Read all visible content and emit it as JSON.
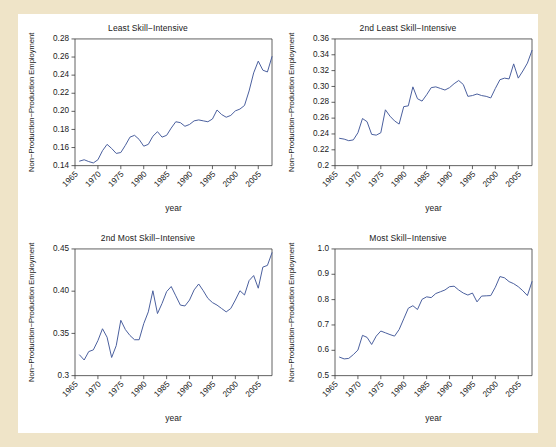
{
  "figure": {
    "background_color": "#efe4c8",
    "panel_background": "#ffffff",
    "line_color": "#4a5f9e",
    "axis_color": "#3a3a3a"
  },
  "chart_data": [
    {
      "type": "line",
      "title": "Least Skill−Intensive",
      "xlabel": "year",
      "ylabel": "Non−Production−Production Employment",
      "xlim": [
        1965,
        2008
      ],
      "ylim": [
        0.14,
        0.28
      ],
      "yticks": [
        "0.14",
        "0.16",
        "0.18",
        "0.20",
        "0.22",
        "0.24",
        "0.26",
        "0.28"
      ],
      "ytick_values": [
        0.14,
        0.16,
        0.18,
        0.2,
        0.22,
        0.24,
        0.26,
        0.28
      ],
      "xticks": [
        "1965",
        "1970",
        "1975",
        "1990",
        "1985",
        "1990",
        "1995",
        "2000",
        "2005"
      ],
      "xtick_values": [
        1965,
        1970,
        1975,
        1980,
        1985,
        1990,
        1995,
        2000,
        2005
      ],
      "grid": false,
      "legend": "none",
      "x": [
        1966,
        1967,
        1968,
        1969,
        1970,
        1971,
        1972,
        1973,
        1974,
        1975,
        1976,
        1977,
        1978,
        1979,
        1980,
        1981,
        1982,
        1983,
        1984,
        1985,
        1986,
        1987,
        1988,
        1989,
        1990,
        1991,
        1992,
        1993,
        1994,
        1995,
        1996,
        1997,
        1998,
        1999,
        2000,
        2001,
        2002,
        2003,
        2004,
        2005,
        2006,
        2007,
        2008
      ],
      "values": [
        0.145,
        0.1465,
        0.1445,
        0.143,
        0.1465,
        0.1565,
        0.1635,
        0.159,
        0.1535,
        0.1545,
        0.1625,
        0.1715,
        0.1735,
        0.169,
        0.1615,
        0.1635,
        0.1725,
        0.1775,
        0.1715,
        0.1735,
        0.1815,
        0.1885,
        0.1875,
        0.1835,
        0.1855,
        0.1895,
        0.1905,
        0.1895,
        0.1885,
        0.1915,
        0.2015,
        0.1965,
        0.1935,
        0.1955,
        0.2005,
        0.2025,
        0.2065,
        0.2225,
        0.2425,
        0.2555,
        0.2455,
        0.2435,
        0.2605
      ]
    },
    {
      "type": "line",
      "title": "2nd Least Skill−Intensive",
      "xlabel": "year",
      "ylabel": "Non−Production−Production Employment",
      "xlim": [
        1965,
        2008
      ],
      "ylim": [
        0.2,
        0.36
      ],
      "yticks": [
        "0.2",
        "0.22",
        "0.24",
        "0.26",
        "0.28",
        "0.30",
        "0.32",
        "0.34",
        "0.36"
      ],
      "ytick_values": [
        0.2,
        0.22,
        0.24,
        0.26,
        0.28,
        0.3,
        0.32,
        0.34,
        0.36
      ],
      "xticks": [
        "1965",
        "1970",
        "1975",
        "1990",
        "1985",
        "1990",
        "1995",
        "2000",
        "2005"
      ],
      "xtick_values": [
        1965,
        1970,
        1975,
        1980,
        1985,
        1990,
        1995,
        2000,
        2005
      ],
      "grid": false,
      "legend": "none",
      "x": [
        1966,
        1967,
        1968,
        1969,
        1970,
        1971,
        1972,
        1973,
        1974,
        1975,
        1976,
        1977,
        1978,
        1979,
        1980,
        1981,
        1982,
        1983,
        1984,
        1985,
        1986,
        1987,
        1988,
        1989,
        1990,
        1991,
        1992,
        1993,
        1994,
        1995,
        1996,
        1997,
        1998,
        1999,
        2000,
        2001,
        2002,
        2003,
        2004,
        2005,
        2006,
        2007,
        2008
      ],
      "values": [
        0.2345,
        0.2335,
        0.2315,
        0.2325,
        0.2415,
        0.2595,
        0.2555,
        0.2395,
        0.2385,
        0.2415,
        0.2705,
        0.2625,
        0.2565,
        0.2525,
        0.2745,
        0.2755,
        0.2995,
        0.2845,
        0.2815,
        0.2895,
        0.2985,
        0.2995,
        0.2975,
        0.2955,
        0.2985,
        0.3035,
        0.3075,
        0.3025,
        0.2875,
        0.2885,
        0.2905,
        0.2885,
        0.2875,
        0.2855,
        0.2975,
        0.3085,
        0.3105,
        0.3095,
        0.3285,
        0.3105,
        0.3195,
        0.3295,
        0.3455
      ]
    },
    {
      "type": "line",
      "title": "2nd Most Skill−Intensive",
      "xlabel": "year",
      "ylabel": "Non−Production−Production Employment",
      "xlim": [
        1965,
        2008
      ],
      "ylim": [
        0.3,
        0.45
      ],
      "yticks": [
        "0.3",
        "0.35",
        "0.40",
        "0.45"
      ],
      "ytick_values": [
        0.3,
        0.35,
        0.4,
        0.45
      ],
      "xticks": [
        "1965",
        "1970",
        "1975",
        "1990",
        "1985",
        "1990",
        "1995",
        "2000",
        "2005"
      ],
      "xtick_values": [
        1965,
        1970,
        1975,
        1980,
        1985,
        1990,
        1995,
        2000,
        2005
      ],
      "grid": false,
      "legend": "none",
      "x": [
        1966,
        1967,
        1968,
        1969,
        1970,
        1971,
        1972,
        1973,
        1974,
        1975,
        1976,
        1977,
        1978,
        1979,
        1980,
        1981,
        1982,
        1983,
        1984,
        1985,
        1986,
        1987,
        1988,
        1989,
        1990,
        1991,
        1992,
        1993,
        1994,
        1995,
        1996,
        1997,
        1998,
        1999,
        2000,
        2001,
        2002,
        2003,
        2004,
        2005,
        2006,
        2007,
        2008
      ],
      "values": [
        0.3245,
        0.3185,
        0.3285,
        0.3305,
        0.3415,
        0.3555,
        0.3455,
        0.3215,
        0.3355,
        0.3655,
        0.3545,
        0.3475,
        0.3425,
        0.3425,
        0.3615,
        0.3755,
        0.4005,
        0.3735,
        0.3855,
        0.3995,
        0.4055,
        0.3945,
        0.3835,
        0.3825,
        0.3895,
        0.4015,
        0.4085,
        0.4005,
        0.3915,
        0.3865,
        0.3835,
        0.3795,
        0.3755,
        0.3795,
        0.3895,
        0.4005,
        0.3955,
        0.4125,
        0.4185,
        0.4035,
        0.4285,
        0.4305,
        0.4455
      ]
    },
    {
      "type": "line",
      "title": "Most Skill−Intensive",
      "xlabel": "year",
      "ylabel": "Non−Production−Production Employment",
      "xlim": [
        1965,
        2008
      ],
      "ylim": [
        0.5,
        1.0
      ],
      "yticks": [
        "0.5",
        "0.6",
        "0.7",
        "0.8",
        "0.9",
        "1.0"
      ],
      "ytick_values": [
        0.5,
        0.6,
        0.7,
        0.8,
        0.9,
        1.0
      ],
      "xticks": [
        "1965",
        "1970",
        "1975",
        "1990",
        "1985",
        "1990",
        "1995",
        "2000",
        "2005"
      ],
      "xtick_values": [
        1965,
        1970,
        1975,
        1980,
        1985,
        1990,
        1995,
        2000,
        2005
      ],
      "grid": false,
      "legend": "none",
      "x": [
        1966,
        1967,
        1968,
        1969,
        1970,
        1971,
        1972,
        1973,
        1974,
        1975,
        1976,
        1977,
        1978,
        1979,
        1980,
        1981,
        1982,
        1983,
        1984,
        1985,
        1986,
        1987,
        1988,
        1989,
        1990,
        1991,
        1992,
        1993,
        1994,
        1995,
        1996,
        1997,
        1998,
        1999,
        2000,
        2001,
        2002,
        2003,
        2004,
        2005,
        2006,
        2007,
        2008
      ],
      "values": [
        0.573,
        0.566,
        0.568,
        0.583,
        0.601,
        0.659,
        0.651,
        0.623,
        0.656,
        0.676,
        0.669,
        0.662,
        0.656,
        0.682,
        0.724,
        0.766,
        0.776,
        0.761,
        0.801,
        0.811,
        0.808,
        0.824,
        0.831,
        0.838,
        0.851,
        0.853,
        0.838,
        0.826,
        0.818,
        0.826,
        0.791,
        0.814,
        0.815,
        0.816,
        0.849,
        0.891,
        0.886,
        0.871,
        0.863,
        0.851,
        0.835,
        0.816,
        0.871
      ]
    }
  ]
}
